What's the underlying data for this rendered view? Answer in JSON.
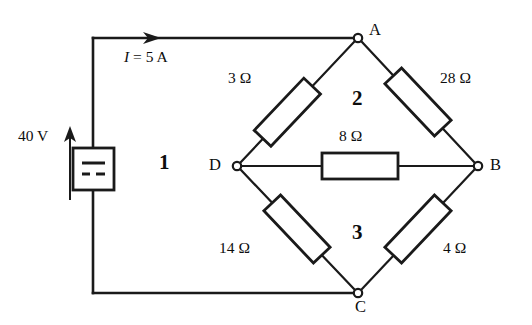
{
  "diagram": {
    "type": "wheatstone-bridge-circuit",
    "source": {
      "label": "40 V",
      "symbol": "dc-voltage-source",
      "polarity_arrow": "up"
    },
    "current": {
      "label": "I = 5 A",
      "symbol": "I",
      "value": "5",
      "unit": "A",
      "direction": "right"
    },
    "nodes": [
      {
        "id": "A",
        "label": "A"
      },
      {
        "id": "B",
        "label": "B"
      },
      {
        "id": "C",
        "label": "C"
      },
      {
        "id": "D",
        "label": "D"
      }
    ],
    "resistors": [
      {
        "id": "r-ad",
        "label": "3 Ω",
        "value": 3,
        "unit": "Ω",
        "between": [
          "A",
          "D"
        ]
      },
      {
        "id": "r-ab",
        "label": "28 Ω",
        "value": 28,
        "unit": "Ω",
        "between": [
          "A",
          "B"
        ]
      },
      {
        "id": "r-db",
        "label": "8 Ω",
        "value": 8,
        "unit": "Ω",
        "between": [
          "D",
          "B"
        ]
      },
      {
        "id": "r-dc",
        "label": "14 Ω",
        "value": 14,
        "unit": "Ω",
        "between": [
          "D",
          "C"
        ]
      },
      {
        "id": "r-cb",
        "label": "4 Ω",
        "value": 4,
        "unit": "Ω",
        "between": [
          "C",
          "B"
        ]
      }
    ],
    "loops": [
      {
        "id": "loop-1",
        "label": "1"
      },
      {
        "id": "loop-2",
        "label": "2"
      },
      {
        "id": "loop-3",
        "label": "3"
      }
    ],
    "colors": {
      "wire": "#1a1a1a",
      "text": "#0d0d0d",
      "background": "#ffffff",
      "node_fill": "#ffffff"
    }
  }
}
